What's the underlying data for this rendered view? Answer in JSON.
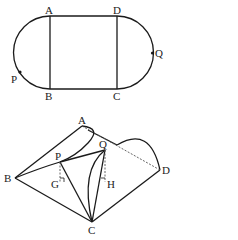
{
  "figure_top": {
    "title": "Track shape: rectangle ABCD with semicircles on AB and CD",
    "labels": {
      "A": "A",
      "B": "B",
      "C": "C",
      "D": "D",
      "P": "P",
      "Q": "Q"
    }
  },
  "figure_bottom": {
    "title": "Folded 3D figure",
    "labels": {
      "A": "A",
      "B": "B",
      "C": "C",
      "D": "D",
      "P": "P",
      "Q": "Q",
      "G": "G",
      "H": "H"
    }
  },
  "colors": {
    "stroke": "#1a1a1a",
    "dashed": "#555555",
    "background": "#ffffff"
  }
}
